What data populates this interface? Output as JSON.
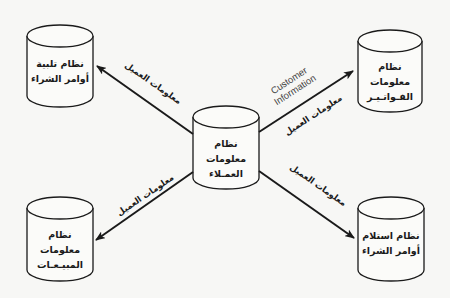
{
  "diagram": {
    "type": "data-flow",
    "colors": {
      "background": "#f7f7f5",
      "stroke": "#1a1a1a",
      "english_text": "#444444"
    },
    "nodes": {
      "center": {
        "line1": "نظام معلومات",
        "line2": "العمـلاء"
      },
      "top_left": {
        "line1": "نظام تلبية",
        "line2": "أوامر الشراء"
      },
      "top_right": {
        "line1": "نظام معلومات",
        "line2": "الفـواتـيـر"
      },
      "bottom_left": {
        "line1": "نظام معلومات",
        "line2": "المبيـعـات"
      },
      "bottom_right": {
        "line1": "نظام استلام",
        "line2": "أوامر الشراء"
      }
    },
    "edges": {
      "to_top_left": {
        "label": "معلومات العميل"
      },
      "to_top_right": {
        "label": "معلومات العميل",
        "label_en_line1": "Customer",
        "label_en_line2": "Information"
      },
      "to_bottom_left": {
        "label": "معلومات العميل"
      },
      "to_bottom_right": {
        "label": "معلومات العميل"
      }
    }
  }
}
